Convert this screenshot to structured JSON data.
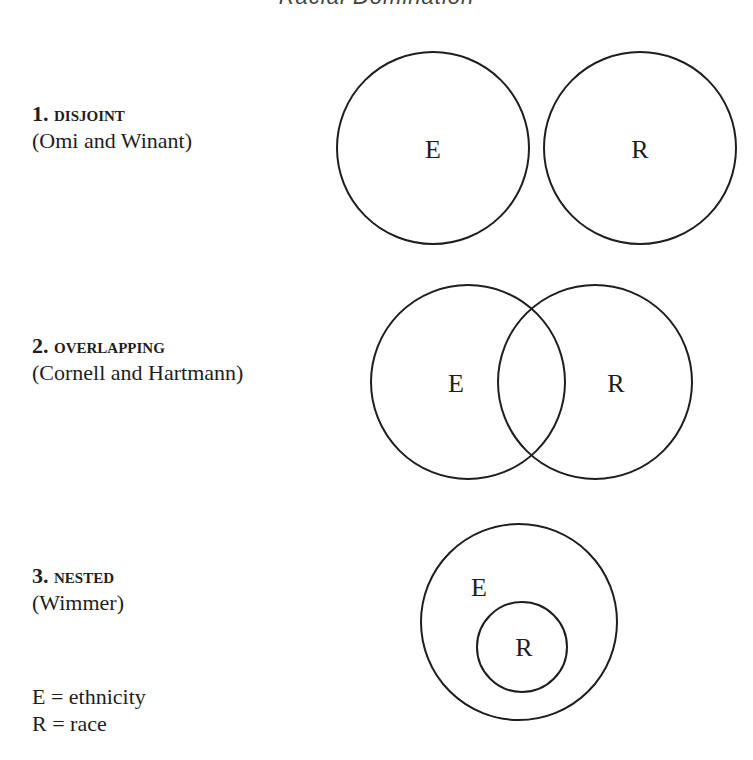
{
  "header": {
    "running_title": "Racial Domination"
  },
  "models": [
    {
      "number": "1.",
      "name": "DISJOINT",
      "source": "(Omi and Winant)",
      "circles": [
        {
          "label": "E",
          "cx": 433,
          "cy": 148,
          "r": 96
        },
        {
          "label": "R",
          "cx": 640,
          "cy": 148,
          "r": 96
        }
      ]
    },
    {
      "number": "2.",
      "name": "OVERLAPPING",
      "source": "(Cornell and Hartmann)",
      "circles": [
        {
          "label": "E",
          "cx": 468,
          "cy": 382,
          "r": 97
        },
        {
          "label": "R",
          "cx": 595,
          "cy": 382,
          "r": 97
        }
      ]
    },
    {
      "number": "3.",
      "name": "NESTED",
      "source": "(Wimmer)",
      "circles": [
        {
          "label": "E",
          "cx": 519,
          "cy": 622,
          "r": 98
        },
        {
          "label": "R",
          "cx": 522,
          "cy": 647,
          "r": 45
        }
      ]
    }
  ],
  "legend": [
    {
      "text": "E = ethnicity"
    },
    {
      "text": "R = race"
    }
  ],
  "colors": {
    "stroke": "#1e1e1e",
    "background": "#ffffff"
  }
}
